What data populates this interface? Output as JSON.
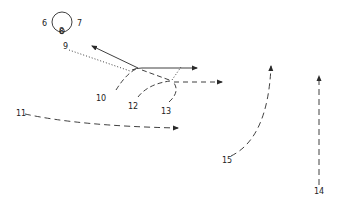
{
  "diagram": {
    "colors": {
      "stroke": "#2a2a2a",
      "background": "#ffffff"
    },
    "nodes": [
      {
        "id": "circle",
        "label": ""
      }
    ],
    "labels": [
      {
        "id": "l6",
        "text": "6"
      },
      {
        "id": "l7",
        "text": "7"
      },
      {
        "id": "l8",
        "text": "8"
      },
      {
        "id": "l9",
        "text": "9"
      },
      {
        "id": "l10",
        "text": "10"
      },
      {
        "id": "l11",
        "text": "11"
      },
      {
        "id": "l12",
        "text": "12"
      },
      {
        "id": "l13",
        "text": "13"
      },
      {
        "id": "l14",
        "text": "14"
      },
      {
        "id": "l15",
        "text": "15"
      }
    ],
    "paths": [
      {
        "id": "p9",
        "style": "dotted",
        "from_label": "9"
      },
      {
        "id": "solid-upleft",
        "style": "solid",
        "arrow": true
      },
      {
        "id": "solid-right",
        "style": "solid",
        "arrow": true
      },
      {
        "id": "p10",
        "style": "dashed",
        "from_label": "10"
      },
      {
        "id": "p11",
        "style": "dashed",
        "from_label": "11",
        "arrow": true
      },
      {
        "id": "p12",
        "style": "dashed",
        "from_label": "12"
      },
      {
        "id": "p13",
        "style": "dashed",
        "from_label": "13"
      },
      {
        "id": "p14",
        "style": "dashed",
        "from_label": "14",
        "arrow": true
      },
      {
        "id": "p15",
        "style": "dashed",
        "from_label": "15",
        "arrow": true
      },
      {
        "id": "dashed-right",
        "style": "dashed",
        "arrow": true
      }
    ]
  }
}
